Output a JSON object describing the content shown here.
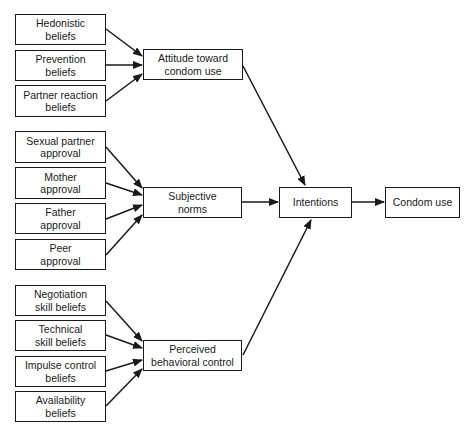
{
  "diagram": {
    "title": "",
    "colors": {
      "stroke": "#1a1a1a",
      "background": "#ffffff",
      "text": "#1a1a1a"
    },
    "nodes": [
      {
        "id": "hedonistic",
        "label": "Hedonistic\nbeliefs",
        "x": 15,
        "y": 14,
        "w": 91,
        "h": 31
      },
      {
        "id": "prevention",
        "label": "Prevention\nbeliefs",
        "x": 15,
        "y": 50,
        "w": 91,
        "h": 31
      },
      {
        "id": "partner_reaction",
        "label": "Partner reaction\nbeliefs",
        "x": 15,
        "y": 85,
        "w": 91,
        "h": 32
      },
      {
        "id": "attitude",
        "label": "Attitude toward\ncondom use",
        "x": 143,
        "y": 49,
        "w": 100,
        "h": 31
      },
      {
        "id": "sexual_partner",
        "label": "Sexual partner\napproval",
        "x": 15,
        "y": 131,
        "w": 91,
        "h": 32
      },
      {
        "id": "mother",
        "label": "Mother\napproval",
        "x": 15,
        "y": 167,
        "w": 91,
        "h": 32
      },
      {
        "id": "father",
        "label": "Father\napproval",
        "x": 15,
        "y": 203,
        "w": 91,
        "h": 31
      },
      {
        "id": "peer",
        "label": "Peer\napproval",
        "x": 15,
        "y": 239,
        "w": 91,
        "h": 31
      },
      {
        "id": "subjective_norms",
        "label": "Subjective\nnorms",
        "x": 143,
        "y": 187,
        "w": 99,
        "h": 31
      },
      {
        "id": "negotiation",
        "label": "Negotiation\nskill beliefs",
        "x": 15,
        "y": 285,
        "w": 91,
        "h": 31
      },
      {
        "id": "technical",
        "label": "Technical\nskill beliefs",
        "x": 15,
        "y": 320,
        "w": 91,
        "h": 31
      },
      {
        "id": "impulse",
        "label": "Impulse control\nbeliefs",
        "x": 15,
        "y": 356,
        "w": 91,
        "h": 31
      },
      {
        "id": "availability",
        "label": "Availability\nbeliefs",
        "x": 15,
        "y": 391,
        "w": 91,
        "h": 31
      },
      {
        "id": "pbc",
        "label": "Perceived\nbehavioral control",
        "x": 143,
        "y": 340,
        "w": 99,
        "h": 31
      },
      {
        "id": "intentions",
        "label": "Intentions",
        "x": 279,
        "y": 187,
        "w": 73,
        "h": 31
      },
      {
        "id": "condom_use",
        "label": "Condom use",
        "x": 385,
        "y": 187,
        "w": 75,
        "h": 31
      }
    ],
    "edges": [
      {
        "from": "hedonistic",
        "to": "attitude",
        "x1": 106,
        "y1": 29,
        "x2": 142,
        "y2": 56
      },
      {
        "from": "prevention",
        "to": "attitude",
        "x1": 106,
        "y1": 65,
        "x2": 142,
        "y2": 65
      },
      {
        "from": "partner_reaction",
        "to": "attitude",
        "x1": 106,
        "y1": 101,
        "x2": 142,
        "y2": 74
      },
      {
        "from": "sexual_partner",
        "to": "subjective_norms",
        "x1": 106,
        "y1": 147,
        "x2": 142,
        "y2": 188
      },
      {
        "from": "mother",
        "to": "subjective_norms",
        "x1": 106,
        "y1": 183,
        "x2": 142,
        "y2": 195
      },
      {
        "from": "father",
        "to": "subjective_norms",
        "x1": 106,
        "y1": 219,
        "x2": 142,
        "y2": 205
      },
      {
        "from": "peer",
        "to": "subjective_norms",
        "x1": 106,
        "y1": 255,
        "x2": 142,
        "y2": 215
      },
      {
        "from": "negotiation",
        "to": "pbc",
        "x1": 106,
        "y1": 301,
        "x2": 142,
        "y2": 341
      },
      {
        "from": "technical",
        "to": "pbc",
        "x1": 106,
        "y1": 335,
        "x2": 142,
        "y2": 348
      },
      {
        "from": "impulse",
        "to": "pbc",
        "x1": 106,
        "y1": 371,
        "x2": 142,
        "y2": 360
      },
      {
        "from": "availability",
        "to": "pbc",
        "x1": 106,
        "y1": 406,
        "x2": 142,
        "y2": 369
      },
      {
        "from": "attitude",
        "to": "intentions",
        "x1": 243,
        "y1": 66,
        "x2": 305,
        "y2": 185
      },
      {
        "from": "subjective_norms",
        "to": "intentions",
        "x1": 242,
        "y1": 202,
        "x2": 278,
        "y2": 202
      },
      {
        "from": "pbc",
        "to": "intentions",
        "x1": 243,
        "y1": 355,
        "x2": 311,
        "y2": 220
      },
      {
        "from": "intentions",
        "to": "condom_use",
        "x1": 352,
        "y1": 202,
        "x2": 384,
        "y2": 202
      }
    ]
  }
}
